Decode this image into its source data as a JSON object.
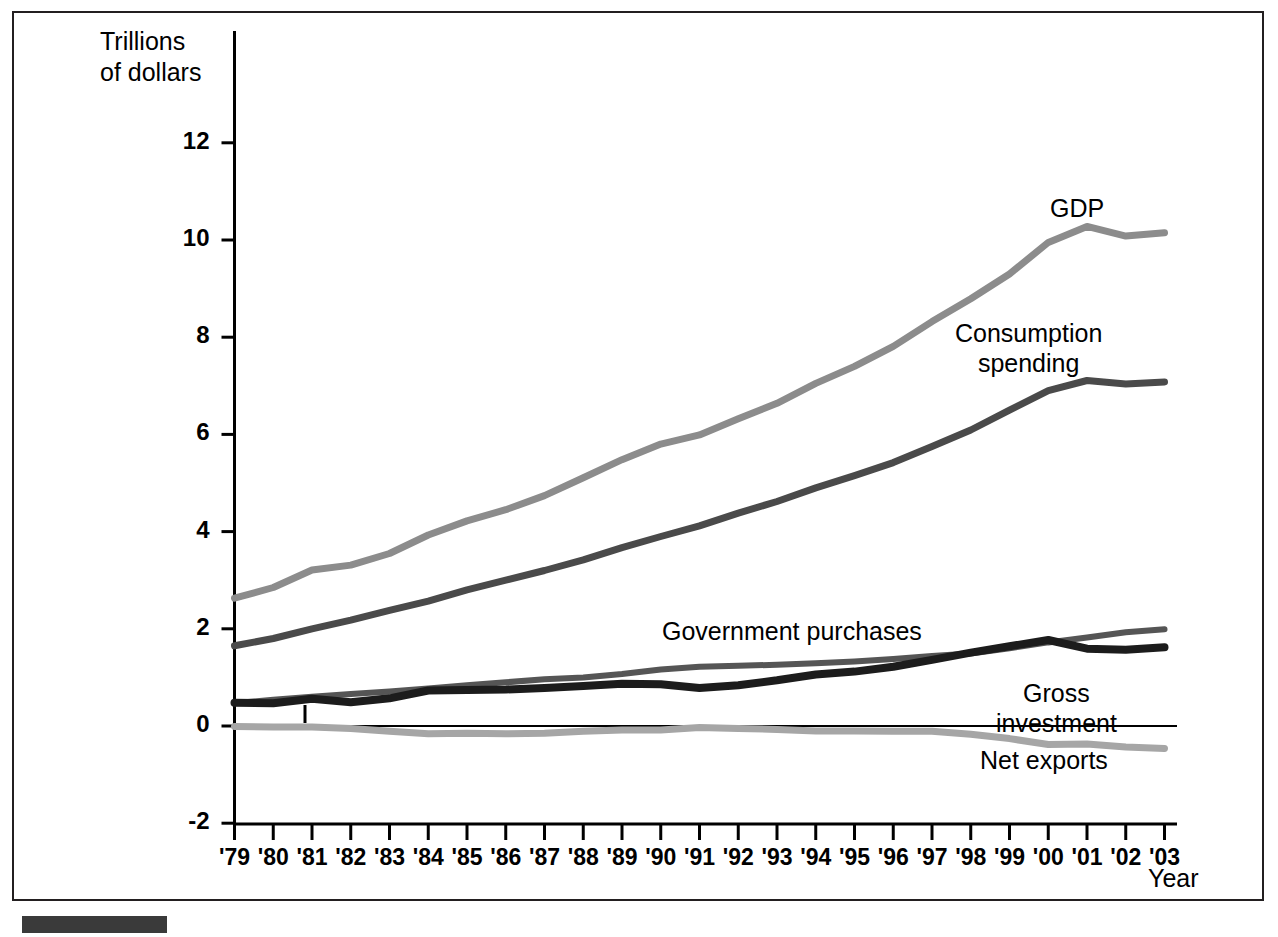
{
  "figure": {
    "y_axis_title": "Trillions\nof dollars",
    "x_axis_title": "Year",
    "frame_color": "#231f20",
    "footer_bar_color": "#3a3a3a"
  },
  "chart_data": {
    "type": "line",
    "title": "",
    "subtitle": "",
    "xlabel": "Year",
    "ylabel": "Trillions of dollars",
    "grid": false,
    "legend": "inline-annotations",
    "xlim": [
      1979,
      2003
    ],
    "ylim": [
      -2,
      13
    ],
    "yticks": [
      -2,
      0,
      2,
      4,
      6,
      8,
      10,
      12
    ],
    "ytick_labels": [
      "-2",
      "0",
      "2",
      "4",
      "6",
      "8",
      "10",
      "12"
    ],
    "x": [
      1979,
      1980,
      1981,
      1982,
      1983,
      1984,
      1985,
      1986,
      1987,
      1988,
      1989,
      1990,
      1991,
      1992,
      1993,
      1994,
      1995,
      1996,
      1997,
      1998,
      1999,
      2000,
      2001,
      2002,
      2003
    ],
    "xtick_labels": [
      "'79",
      "'80",
      "'81",
      "'82",
      "'83",
      "'84",
      "'85",
      "'86",
      "'87",
      "'88",
      "'89",
      "'90",
      "'91",
      "'92",
      "'93",
      "'94",
      "'95",
      "'96",
      "'97",
      "'98",
      "'99",
      "'00",
      "'01",
      "'02",
      "'03"
    ],
    "series": [
      {
        "name": "GDP",
        "label": "GDP",
        "color": "#8c8c8c",
        "width": 7,
        "values": [
          2.63,
          2.85,
          3.21,
          3.31,
          3.55,
          3.93,
          4.22,
          4.45,
          4.74,
          5.11,
          5.48,
          5.8,
          5.99,
          6.32,
          6.64,
          7.05,
          7.4,
          7.81,
          8.32,
          8.79,
          9.3,
          9.95,
          10.28,
          10.08,
          10.15
        ]
      },
      {
        "name": "Consumption spending",
        "label": "Consumption\nspending",
        "color": "#4a4a4a",
        "width": 7,
        "values": [
          1.65,
          1.8,
          2.0,
          2.18,
          2.38,
          2.57,
          2.8,
          3.0,
          3.2,
          3.42,
          3.67,
          3.9,
          4.12,
          4.38,
          4.62,
          4.9,
          5.15,
          5.42,
          5.75,
          6.09,
          6.5,
          6.9,
          7.11,
          7.04,
          7.08
        ]
      },
      {
        "name": "Government purchases",
        "label": "Government purchases",
        "color": "#555555",
        "width": 6,
        "values": [
          0.47,
          0.54,
          0.6,
          0.66,
          0.71,
          0.77,
          0.84,
          0.9,
          0.96,
          1.0,
          1.07,
          1.16,
          1.22,
          1.24,
          1.26,
          1.29,
          1.33,
          1.38,
          1.44,
          1.49,
          1.6,
          1.72,
          1.82,
          1.93,
          1.99
        ]
      },
      {
        "name": "Gross investment",
        "label": "Gross\ninvestment",
        "color": "#1c1c1c",
        "width": 8,
        "values": [
          0.48,
          0.47,
          0.56,
          0.49,
          0.57,
          0.73,
          0.74,
          0.75,
          0.78,
          0.82,
          0.87,
          0.86,
          0.78,
          0.84,
          0.94,
          1.06,
          1.12,
          1.22,
          1.36,
          1.51,
          1.64,
          1.77,
          1.59,
          1.57,
          1.62
        ]
      },
      {
        "name": "Net exports",
        "label": "Net exports",
        "color": "#a6a6a6",
        "width": 7,
        "values": [
          -0.01,
          -0.02,
          -0.02,
          -0.05,
          -0.11,
          -0.16,
          -0.15,
          -0.16,
          -0.15,
          -0.11,
          -0.08,
          -0.08,
          -0.03,
          -0.05,
          -0.07,
          -0.1,
          -0.1,
          -0.11,
          -0.11,
          -0.17,
          -0.26,
          -0.38,
          -0.37,
          -0.43,
          -0.46
        ]
      }
    ]
  }
}
